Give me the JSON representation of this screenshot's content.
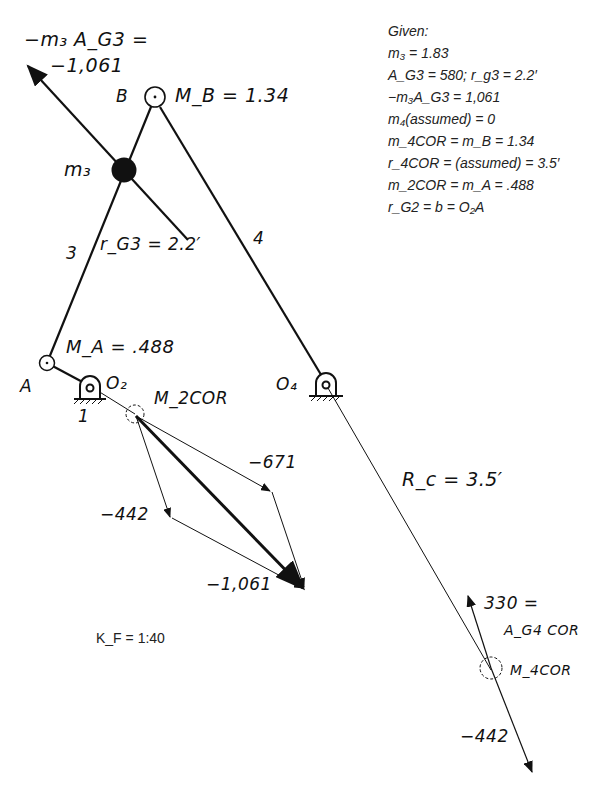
{
  "given": {
    "title": "Given:",
    "lines": [
      "m₃ = 1.83",
      "A_G3 = 580; r_g3 = 2.2′",
      "−m₃A_G3 = 1,061",
      "m₄(assumed) = 0",
      "m_4COR = m_B = 1.34",
      "r_4COR = (assumed) = 3.5′",
      "m_2COR = m_A = .488",
      "r_G2 = b = O₂A"
    ]
  },
  "scale": "K_F = 1:40",
  "labels": {
    "inertia_force": "−m₃ A_G3 =",
    "inertia_value": "−1,061",
    "point_b": "B",
    "mass_b": "M_B = 1.34",
    "mass_3": "m₃",
    "link_3": "3",
    "r_g3": "r_G3 = 2.2′",
    "link_4": "4",
    "point_a": "A",
    "mass_a": "M_A = .488",
    "pivot_o2": "O₂",
    "ground_1": "1",
    "m2cor": "M_2COR",
    "pivot_o4": "O₄",
    "rc": "R_c = 3.5′",
    "v671": "−671",
    "v442": "−442",
    "v1061": "−1,061",
    "a4cor_value": "330 =",
    "a4cor": "A_G4 COR",
    "m4cor": "M_4COR",
    "v442b": "−442"
  },
  "colors": {
    "ink": "#111111",
    "background": "#ffffff"
  }
}
